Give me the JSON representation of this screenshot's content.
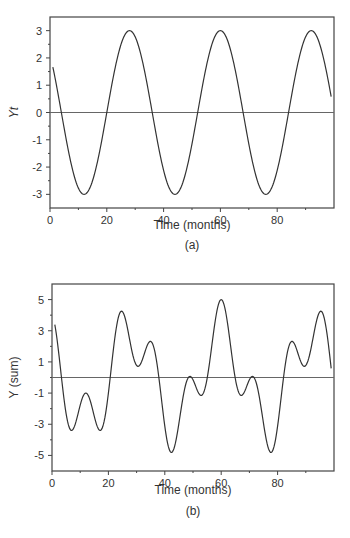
{
  "chart_data": [
    {
      "id": "a",
      "type": "line",
      "caption": "(a)",
      "title": "",
      "xlabel": "Time (months)",
      "ylabel": "Yt",
      "xlim": [
        0,
        100
      ],
      "ylim": [
        -3.5,
        3.5
      ],
      "xticks": [
        0,
        20,
        40,
        60,
        80
      ],
      "yticks": [
        3,
        2,
        1,
        0,
        -1,
        -2,
        -3
      ],
      "grid": false,
      "reference_line_y": 0,
      "description": "Sinusoid with amplitude 3 and period 32 months; peaks at t≈28, 60, 92; troughs at t≈12, 44, 76",
      "x": [
        1,
        4,
        8,
        12,
        16,
        20,
        24,
        28,
        32,
        36,
        40,
        44,
        48,
        52,
        56,
        60,
        64,
        68,
        72,
        76,
        80,
        84,
        88,
        92,
        96,
        99
      ],
      "values": [
        1.67,
        -0.59,
        -2.12,
        -3.0,
        -2.77,
        -1.15,
        1.15,
        3.0,
        2.12,
        0.0,
        -2.12,
        -3.0,
        -2.12,
        0.0,
        2.12,
        3.0,
        2.12,
        0.0,
        -2.12,
        -3.0,
        -2.12,
        0.0,
        2.12,
        3.0,
        2.12,
        0.29
      ]
    },
    {
      "id": "b",
      "type": "line",
      "caption": "(b)",
      "title": "",
      "xlabel": "Time (months)",
      "ylabel": "Y (sum)",
      "xlim": [
        0,
        100
      ],
      "ylim": [
        -6,
        6
      ],
      "xticks": [
        0,
        20,
        40,
        60,
        80
      ],
      "yticks": [
        5,
        3,
        1,
        -1,
        -3,
        -5
      ],
      "grid": false,
      "reference_line_y": 0,
      "description": "Sum of period-32 (amp 3) and period-12 (amp 2) cycles; max ≈5 at t=60, min ≈-4.7 at t≈42 and 78",
      "x": [
        1,
        6,
        12,
        17,
        24,
        29,
        35,
        42,
        48,
        52,
        60,
        67,
        71,
        78,
        85,
        89,
        95,
        99
      ],
      "values": [
        3.4,
        -3.3,
        -1.0,
        -3.3,
        4.2,
        0.8,
        2.3,
        -4.6,
        0.0,
        -1.0,
        5.0,
        -1.0,
        0.0,
        -4.6,
        2.3,
        0.8,
        4.2,
        -0.5
      ]
    }
  ]
}
